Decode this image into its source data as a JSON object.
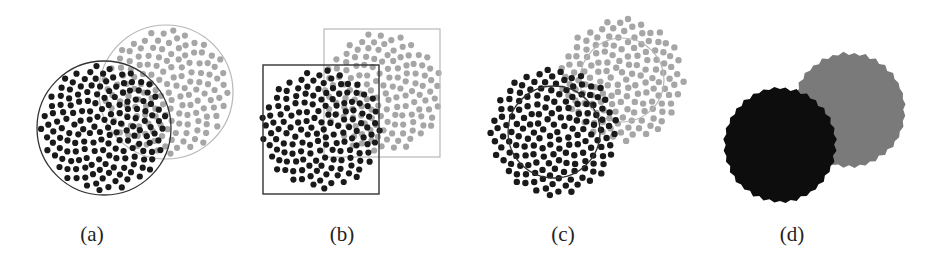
{
  "figure": {
    "panels": [
      {
        "id": "a",
        "label": "(a)",
        "label_x": 92,
        "shape": "circle",
        "black": {
          "cx": 104,
          "cy": 128,
          "r": 67
        },
        "gray": {
          "cx": 166,
          "cy": 92,
          "r": 67
        }
      },
      {
        "id": "b",
        "label": "(b)",
        "label_x": 342,
        "shape": "square",
        "black": {
          "x": 263,
          "y": 65,
          "w": 116,
          "h": 129
        },
        "gray": {
          "x": 324,
          "y": 29,
          "w": 116,
          "h": 128
        }
      },
      {
        "id": "c",
        "label": "(c)",
        "label_x": 563,
        "shape": "circle-ring",
        "black": {
          "cx": 554,
          "cy": 132,
          "r_dots": 64,
          "r_circle": 46
        },
        "gray": {
          "cx": 622,
          "cy": 80,
          "r_dots": 62,
          "r_circle": 42
        }
      },
      {
        "id": "d",
        "label": "(d)",
        "label_x": 792,
        "shape": "solid-blob",
        "black": {
          "cx": 780,
          "cy": 145,
          "r": 55
        },
        "gray": {
          "cx": 849,
          "cy": 110,
          "r": 55
        }
      }
    ],
    "colors": {
      "black_dot": "#1a1a1a",
      "gray_dot": "#a6a6a6",
      "black_outline": "#333333",
      "gray_outline": "#b8b8b8",
      "black_fill": "#0d0d0d",
      "gray_fill": "#7a7a7a"
    }
  }
}
